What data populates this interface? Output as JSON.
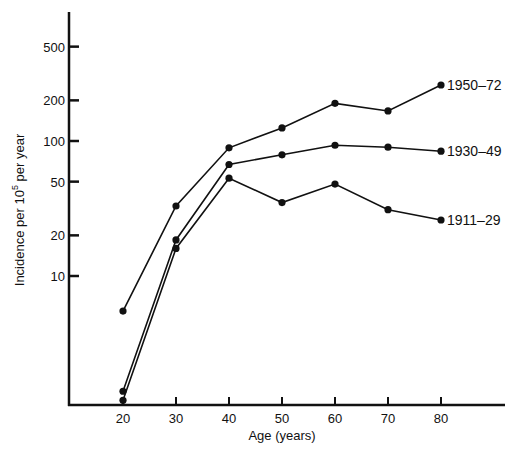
{
  "chart_data": {
    "type": "line",
    "title": "",
    "xlabel": "Age (years)",
    "ylabel": "Incidence per 10^5 per year",
    "ylabel_parts": {
      "pre": "Incidence per 10",
      "sup": "5",
      "post": " per year"
    },
    "yscale": "log",
    "grid": false,
    "legend_position": "inline-right",
    "x": [
      20,
      30,
      40,
      50,
      60,
      70,
      80
    ],
    "x_ticks": [
      "20",
      "30",
      "40",
      "50",
      "60",
      "70",
      "80"
    ],
    "y_ticks": [
      {
        "value": 500,
        "label": "500"
      },
      {
        "value": 200,
        "label": "200"
      },
      {
        "value": 100,
        "label": "100"
      },
      {
        "value": 50,
        "label": "50"
      },
      {
        "value": 20,
        "label": "20"
      },
      {
        "value": 10,
        "label": "10"
      }
    ],
    "ylim": [
      1,
      1000
    ],
    "xlim": [
      10,
      92
    ],
    "series": [
      {
        "name": "1950–72",
        "values": [
          5.5,
          33,
          89,
          125,
          190,
          167,
          260
        ]
      },
      {
        "name": "1930–49",
        "values": [
          1.4,
          18.5,
          67,
          79,
          93,
          90,
          84
        ]
      },
      {
        "name": "1911–29",
        "values": [
          1.2,
          16,
          53,
          35,
          48,
          31,
          26
        ]
      }
    ]
  },
  "colors": {
    "line": "#111111",
    "background": "#ffffff"
  }
}
